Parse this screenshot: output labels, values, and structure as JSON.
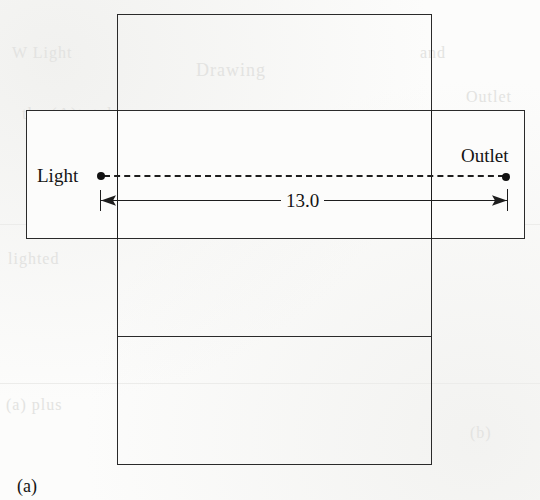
{
  "figure": {
    "caption": "(a)",
    "background_color": "#fcfcfb",
    "line_color": "#2a2a2a",
    "labels": {
      "light": "Light",
      "outlet": "Outlet"
    },
    "dimension": {
      "value": "13.0",
      "style": "double-headed-arrow",
      "units_shown": false
    },
    "connection": {
      "style": "dashed",
      "from": "Light",
      "to": "Outlet"
    },
    "shapes": [
      {
        "name": "vertical-panel",
        "x": 117,
        "y": 14,
        "width": 315,
        "height": 451
      },
      {
        "name": "horizontal-panel",
        "x": 26,
        "y": 110,
        "width": 499,
        "height": 129
      }
    ],
    "fold_lines": [
      {
        "name": "lower-fold-line",
        "x": 118,
        "y": 336,
        "width": 313
      }
    ]
  },
  "scan_artifacts": {
    "ghost_text": [
      {
        "text": "W    Light",
        "x": 12,
        "y": 52,
        "size": 16
      },
      {
        "text": "Drawing",
        "x": 196,
        "y": 68,
        "size": 18
      },
      {
        "text": "the (A)tutels",
        "x": 22,
        "y": 112,
        "size": 17
      },
      {
        "text": "lighted",
        "x": 8,
        "y": 258,
        "size": 16
      },
      {
        "text": "(a) plus",
        "x": 6,
        "y": 404,
        "size": 16
      },
      {
        "text": "and",
        "x": 420,
        "y": 52,
        "size": 16
      },
      {
        "text": "Outlet",
        "x": 466,
        "y": 96,
        "size": 16
      },
      {
        "text": "(b)",
        "x": 470,
        "y": 432,
        "size": 16
      }
    ],
    "rules": [
      {
        "x": 0,
        "y": 224,
        "width": 540
      },
      {
        "x": 0,
        "y": 383,
        "width": 540
      }
    ]
  }
}
